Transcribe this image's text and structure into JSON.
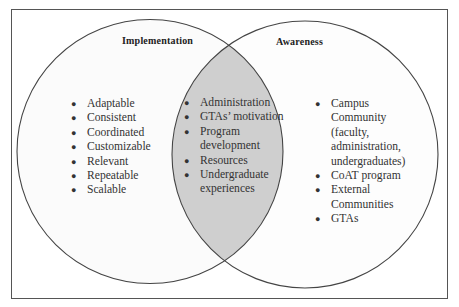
{
  "diagram": {
    "type": "venn",
    "colors": {
      "frame": "#555555",
      "circle_stroke": "#444444",
      "left_fill": "#fbfbfb",
      "right_fill": "#fdfdfd",
      "overlap_fill": "#cfcfcf"
    },
    "left": {
      "title": "Implementation",
      "items": [
        "Adaptable",
        "Consistent",
        "Coordinated",
        "Customizable",
        "Relevant",
        "Repeatable",
        "Scalable"
      ]
    },
    "overlap": {
      "items": [
        "Administration",
        "GTAs’ motivation",
        "Program development",
        "Resources",
        "Undergraduate experiences"
      ]
    },
    "right": {
      "title": "Awareness",
      "items": [
        "Campus Community (faculty, administration, undergraduates)",
        "CoAT program",
        "External Communities",
        "GTAs"
      ]
    },
    "bullet": "●"
  }
}
